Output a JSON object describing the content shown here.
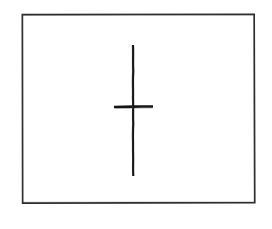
{
  "document": {
    "kind": "scanned-line-drawing",
    "title": "",
    "caption": "",
    "background_color": "#ffffff",
    "ink_color": "#1a1a1a",
    "canvas": {
      "width": 272,
      "height": 229
    }
  },
  "figure": {
    "name": "bordered-frame-with-cross-mark",
    "frame": {
      "label": "frame-rectangle",
      "x": 22,
      "y": 14,
      "width": 233,
      "height": 189,
      "stroke_color": "#2b2b2b",
      "stroke_width": 1.6,
      "fill": "none"
    },
    "marks": [
      {
        "name": "vertical-stroke",
        "type": "line",
        "x1": 133,
        "y1": 45,
        "x2": 133.5,
        "y2": 176,
        "stroke_color": "#151515",
        "stroke_width": 2.2,
        "length": 131,
        "orientation": "vertical"
      },
      {
        "name": "horizontal-stroke",
        "type": "line",
        "x1": 114,
        "y1": 107,
        "x2": 153,
        "y2": 106.5,
        "stroke_color": "#151515",
        "stroke_width": 2.6,
        "length": 39,
        "orientation": "horizontal"
      }
    ],
    "intersection": {
      "name": "cross-center",
      "x": 133,
      "y": 107
    }
  },
  "annotations": {
    "labels": [],
    "texts": []
  }
}
